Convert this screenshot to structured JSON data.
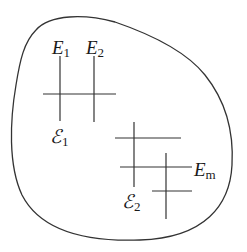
{
  "diagram": {
    "type": "region-with-line-systems",
    "colors": {
      "stroke": "#333333",
      "text": "#1a1a1a",
      "background": "#ffffff"
    },
    "labels": {
      "e1": {
        "base": "E",
        "sub": "1"
      },
      "e2": {
        "base": "E",
        "sub": "2"
      },
      "em": {
        "base": "E",
        "sub": "m"
      },
      "calE1": {
        "base": "ℰ",
        "sub": "1"
      },
      "calE2": {
        "base": "ℰ",
        "sub": "2"
      }
    }
  }
}
